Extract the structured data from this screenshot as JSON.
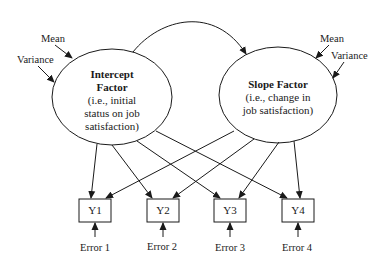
{
  "figure": {
    "type": "latent growth curve model path diagram",
    "covariance_arrow": "double-headed curved arrow between factors"
  },
  "factors": [
    {
      "id": "intercept",
      "title_line1": "Intercept",
      "title_line2": "Factor",
      "desc_line1": "(i.e., initial",
      "desc_line2": "status on job",
      "desc_line3": "satisfaction)",
      "mean_label": "Mean",
      "variance_label": "Variance"
    },
    {
      "id": "slope",
      "title_line1": "Slope Factor",
      "desc_line1": "(i.e., change in",
      "desc_line2": "job satisfaction)",
      "mean_label": "Mean",
      "variance_label": "Variance"
    }
  ],
  "indicators": [
    {
      "label": "Y1",
      "error": "Error 1"
    },
    {
      "label": "Y2",
      "error": "Error 2"
    },
    {
      "label": "Y3",
      "error": "Error 3"
    },
    {
      "label": "Y4",
      "error": "Error 4"
    }
  ]
}
